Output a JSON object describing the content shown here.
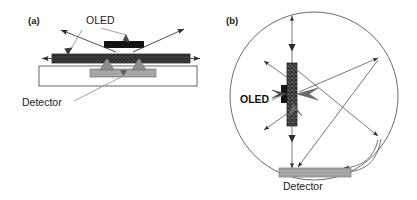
{
  "figure": {
    "width": 417,
    "height": 200,
    "background": "#ffffff"
  },
  "panels": [
    {
      "id": "panel-a",
      "label": "(a)",
      "description": "Side view of OLED on substrate with detector beneath",
      "labels": [
        {
          "name": "oled-label",
          "text": "OLED",
          "bold": false,
          "x": 86,
          "y": 24
        },
        {
          "name": "detector-label",
          "text": "Detector",
          "bold": false,
          "x": 22,
          "y": 106
        }
      ]
    },
    {
      "id": "panel-b",
      "label": "(b)",
      "description": "Top view of OLED inside integrating sphere with detector at bottom",
      "labels": [
        {
          "name": "oled-label",
          "text": "OLED",
          "bold": true,
          "x": 240,
          "y": 103
        },
        {
          "name": "detector-label",
          "text": "Detector",
          "bold": false,
          "x": 283,
          "y": 190
        }
      ]
    }
  ],
  "colors": {
    "hatch_dark": "#4a4a4a",
    "hatch_light": "#d8d8d8",
    "cathode_black": "#1a1a1a",
    "detector_gray": "#a8a8a8",
    "detector_gray_dark": "#8c8c8c",
    "ray_stroke": "#3a3a3a",
    "leader_stroke": "#8a8a8a",
    "outline_stroke": "#555555",
    "sphere_stroke": "#6a6a6a",
    "text": "#1a1a1a",
    "background": "#ffffff"
  },
  "geometry": {
    "panel_a": {
      "oled_layer": {
        "x": 52,
        "y": 54,
        "width": 138,
        "height": 9
      },
      "cathode": {
        "x": 104,
        "y": 41,
        "width": 40,
        "height": 7
      },
      "substrate": {
        "x": 39,
        "y": 66,
        "width": 158,
        "height": 20
      },
      "detector_bar": {
        "x": 90,
        "y": 69,
        "width": 66,
        "height": 8
      },
      "arrows": [
        {
          "name": "up-left-ray",
          "x1": 115,
          "y1": 53,
          "x2": 59,
          "y2": 29
        },
        {
          "name": "up-right-ray",
          "x1": 131,
          "y1": 53,
          "x2": 185,
          "y2": 28
        },
        {
          "name": "left-ray",
          "x1": 110,
          "y1": 58,
          "x2": 40,
          "y2": 58
        },
        {
          "name": "right-ray",
          "x1": 134,
          "y1": 58,
          "x2": 201,
          "y2": 58
        },
        {
          "name": "down-left-ray",
          "x1": 113,
          "y1": 58,
          "x2": 104,
          "y2": 70
        },
        {
          "name": "down-right-ray",
          "x1": 134,
          "y1": 58,
          "x2": 143,
          "y2": 70
        }
      ]
    },
    "panel_b": {
      "sphere": {
        "cx": 314,
        "cy": 96,
        "r": 84
      },
      "oled_bar": {
        "x": 287,
        "y": 63,
        "width": 10,
        "height": 63
      },
      "oled_contact": {
        "x": 281,
        "y": 85,
        "width": 6,
        "height": 17
      },
      "detector_bar": {
        "x": 279,
        "y": 168,
        "width": 72,
        "height": 9
      },
      "rays": [
        {
          "name": "vertical-up-ray"
        },
        {
          "name": "vertical-down-ray"
        },
        {
          "name": "emit-up-left-ray"
        },
        {
          "name": "emit-down-left-ray"
        },
        {
          "name": "emit-right-upper-ray"
        },
        {
          "name": "bounce-upper-right-ray"
        },
        {
          "name": "bounce-lower-right-ray"
        },
        {
          "name": "return-to-detector-left-ray"
        },
        {
          "name": "return-to-detector-right-ray"
        }
      ]
    }
  }
}
